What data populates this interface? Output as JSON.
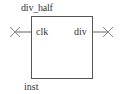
{
  "symbol": {
    "name": "div_half",
    "instance": "inst",
    "pins": {
      "input": {
        "label": "clk",
        "direction": "input",
        "connected": false
      },
      "output": {
        "label": "div",
        "direction": "output",
        "connected": false
      }
    },
    "icons": {
      "unconnected_marker": "x-mark"
    },
    "colors": {
      "line": "#555555",
      "text": "#333333",
      "marker": "#888888"
    }
  }
}
